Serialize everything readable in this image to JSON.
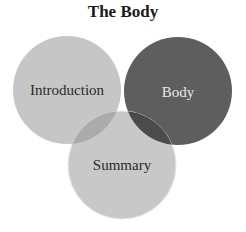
{
  "title": "The Body",
  "circles": [
    {
      "label": "Introduction",
      "cx": 67,
      "cy": 90,
      "r": 54,
      "fill": "#c6c6c6",
      "text_color": "#2a2a2a"
    },
    {
      "label": "Body",
      "cx": 178,
      "cy": 91,
      "r": 54,
      "fill": "#5e5e5e",
      "text_color": "#e8e8e8"
    },
    {
      "label": "Summary",
      "cx": 122,
      "cy": 165,
      "r": 54,
      "fill": "#c8c8c8",
      "text_color": "#2a2a2a"
    }
  ],
  "overlap_colors": {
    "introduction_summary": "#ababab",
    "body_summary": "#4b4b4b"
  }
}
